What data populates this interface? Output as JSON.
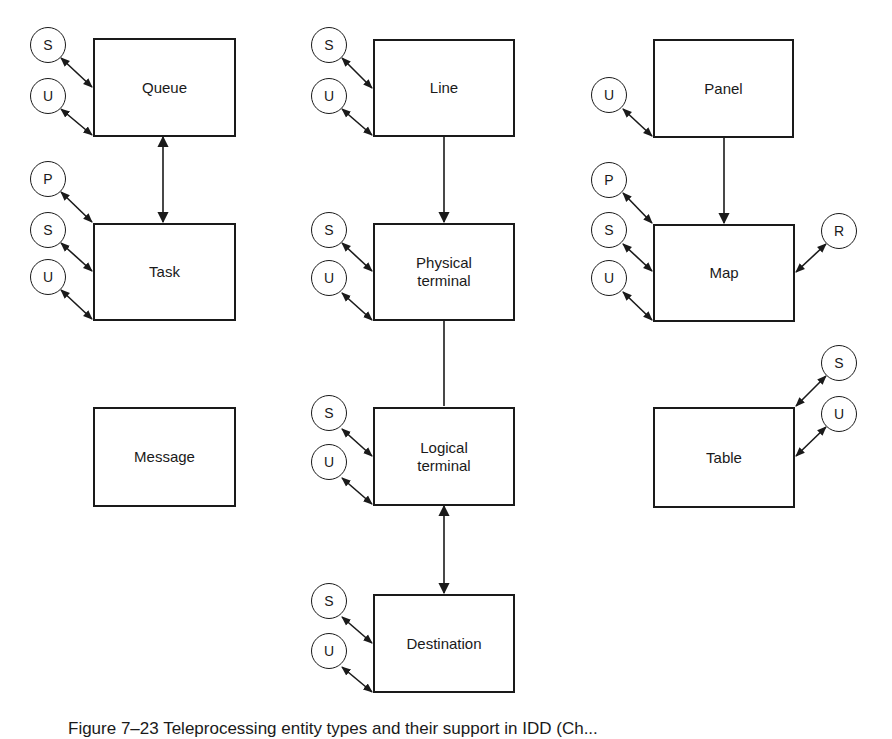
{
  "diagram": {
    "boxes": {
      "queue": {
        "label": "Queue"
      },
      "task": {
        "label": "Task"
      },
      "message": {
        "label": "Message"
      },
      "line": {
        "label": "Line"
      },
      "physical_terminal": {
        "label": "Physical\nterminal"
      },
      "logical_terminal": {
        "label": "Logical\nterminal"
      },
      "destination": {
        "label": "Destination"
      },
      "panel": {
        "label": "Panel"
      },
      "map": {
        "label": "Map"
      },
      "table": {
        "label": "Table"
      }
    },
    "markers": {
      "queue": [
        "S",
        "U"
      ],
      "task": [
        "P",
        "S",
        "U"
      ],
      "line": [
        "S",
        "U"
      ],
      "physical_terminal": [
        "S",
        "U"
      ],
      "logical_terminal": [
        "S",
        "U"
      ],
      "destination": [
        "S",
        "U"
      ],
      "panel": [
        "U"
      ],
      "map_left": [
        "P",
        "S",
        "U"
      ],
      "map_right": [
        "R"
      ],
      "table_right": [
        "S",
        "U"
      ]
    },
    "connections": [
      {
        "from": "Queue",
        "to": "Task",
        "type": "bidirectional"
      },
      {
        "from": "Line",
        "to": "Physical terminal",
        "type": "directed"
      },
      {
        "from": "Physical terminal",
        "to": "Logical terminal",
        "type": "plain"
      },
      {
        "from": "Logical terminal",
        "to": "Destination",
        "type": "bidirectional"
      },
      {
        "from": "Panel",
        "to": "Map",
        "type": "directed"
      }
    ],
    "caption": "Figure 7–23   Teleprocessing entity types and their support in IDD (Ch..."
  },
  "colors": {
    "ink": "#1a1a1a",
    "background": "#ffffff"
  }
}
